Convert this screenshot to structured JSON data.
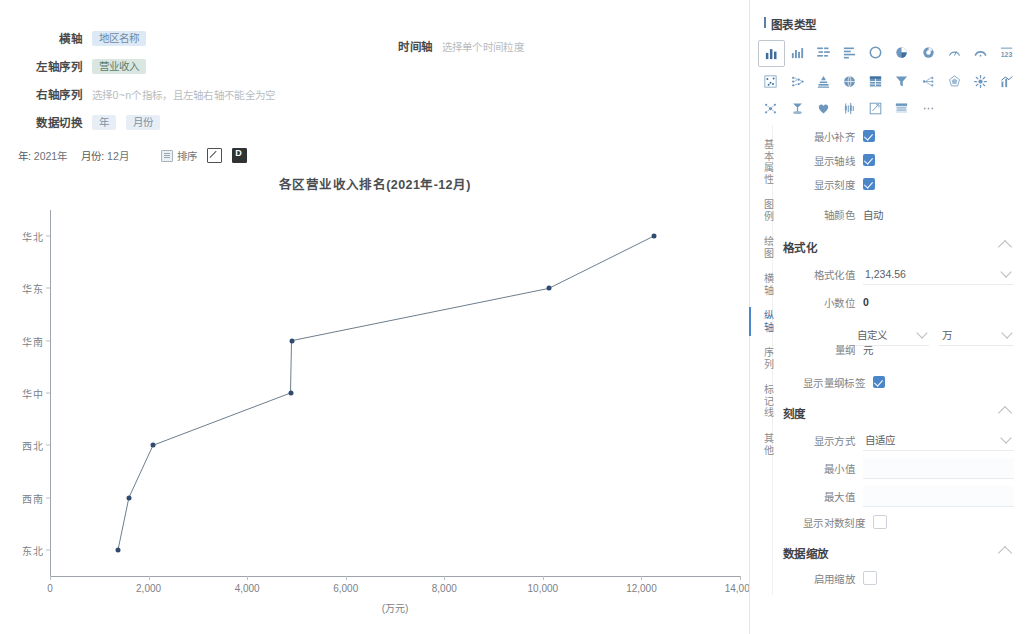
{
  "config": {
    "rows": [
      {
        "label": "横轴",
        "chip": "地区名称",
        "chip_style": "blue"
      },
      {
        "label": "左轴序列",
        "chip": "营业收入",
        "chip_style": "green"
      },
      {
        "label": "右轴序列",
        "hint": "选择0~n个指标，且左轴右轴不能全为空"
      },
      {
        "label": "数据切换",
        "chip": "年",
        "chip2": "月份"
      }
    ],
    "time_axis": {
      "label": "时间轴",
      "hint": "选择单个时间粒度"
    }
  },
  "toolbar": {
    "year_label": "年:",
    "year_value": "2021年",
    "month_label": "月份:",
    "month_value": "12月",
    "sort_label": "排序",
    "edit_icon": "pen-square-icon",
    "export_icon": "export-doc-icon"
  },
  "chart_data": {
    "type": "line",
    "title": "各区营业收入排名(2021年-12月)",
    "xlabel": "(万元)",
    "ylabel": "",
    "orientation": "horizontal",
    "categories": [
      "东北",
      "西南",
      "西北",
      "华中",
      "华南",
      "华东",
      "华北"
    ],
    "values": [
      1380,
      1600,
      2090,
      4880,
      4900,
      10120,
      12250
    ],
    "xlim": [
      0,
      14000
    ],
    "xticks": [
      "0",
      "2,000",
      "4,000",
      "6,000",
      "8,000",
      "10,000",
      "12,000",
      "14,000"
    ],
    "xtick_values": [
      0,
      2000,
      4000,
      6000,
      8000,
      10000,
      12000,
      14000
    ],
    "grid": false,
    "legend": "none",
    "series_color": "#2f4b6e",
    "line_color": "#6e7d8c"
  },
  "panel": {
    "chart_type_title": "图表类型",
    "icons_row1": [
      "column-chart-icon",
      "bar-group-icon",
      "butterfly-chart-icon",
      "horizontal-bar-icon",
      "ring-chart-icon",
      "pie-chart-icon",
      "donut-chart-icon",
      "gauge-half-icon",
      "gauge-arc-icon",
      "number-123-icon"
    ],
    "icons_row2": [
      "scatter-matrix-icon",
      "tree-chart-icon",
      "pyramid-chart-icon",
      "globe-map-icon",
      "table-chart-icon",
      "funnel-chart-icon",
      "relation-graph-icon",
      "radar-chart-icon",
      "sunburst-chart-icon",
      "combo-chart-icon"
    ],
    "icons_row3": [
      "network-chart-icon",
      "word-cloud-icon",
      "heart-rate-icon",
      "candlestick-icon",
      "edit-square-icon",
      "list-card-icon",
      "more-options-icon"
    ],
    "tabs": [
      {
        "label": "基本属性",
        "active": false
      },
      {
        "label": "图例",
        "active": false
      },
      {
        "label": "绘图",
        "active": false
      },
      {
        "label": "横轴",
        "active": false
      },
      {
        "label": "纵轴",
        "active": true
      },
      {
        "label": "序列",
        "active": false
      },
      {
        "label": "标记线",
        "active": false
      },
      {
        "label": "其他",
        "active": false
      }
    ],
    "axis_fields": [
      {
        "label": "最小补齐",
        "checked": true
      },
      {
        "label": "显示轴线",
        "checked": true
      },
      {
        "label": "显示刻度",
        "checked": true
      }
    ],
    "axis_color": {
      "label": "轴颜色",
      "value": "自动"
    },
    "format_section": {
      "title": "格式化",
      "format_value": {
        "label": "格式化值",
        "value": "1,234.56"
      },
      "decimal": {
        "label": "小数位",
        "value": "0"
      },
      "dimension": {
        "label": "量纲",
        "mode": "自定义",
        "unit": "万",
        "suffix": "元"
      },
      "show_dimension_label": {
        "label": "显示量纲标签",
        "checked": true
      }
    },
    "scale_section": {
      "title": "刻度",
      "display_mode": {
        "label": "显示方式",
        "value": "自适应"
      },
      "min": {
        "label": "最小值",
        "value": ""
      },
      "max": {
        "label": "最大值",
        "value": ""
      },
      "log_scale": {
        "label": "显示对数刻度",
        "checked": false
      }
    },
    "zoom_section": {
      "title": "数据缩放",
      "enable": {
        "label": "启用缩放",
        "checked": false
      },
      "start": {
        "label": "开始位置",
        "value": "70",
        "unit": "%"
      }
    },
    "highlight_color": "#e8542a"
  }
}
